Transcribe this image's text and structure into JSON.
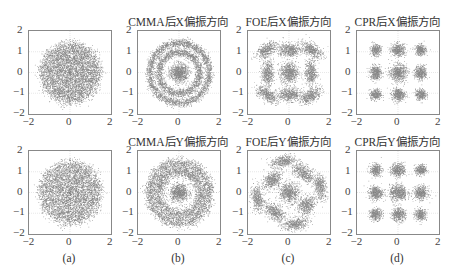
{
  "chart_data": [
    {
      "id": "a-x",
      "type": "scatter",
      "row": 0,
      "col": 0,
      "title": "",
      "xlim": [
        -2,
        2
      ],
      "ylim": [
        -2,
        2
      ],
      "xticks": [
        "-2",
        "0",
        "2"
      ],
      "yticks": [
        "2",
        "1",
        "0",
        "-1",
        "-2"
      ],
      "grid": true,
      "description": "Noisy unstructured disk of points, radius ~1.5, centered at origin",
      "clusters": [
        {
          "kind": "disk",
          "cx": 0,
          "cy": 0,
          "r": 1.45,
          "sigma": 0.25,
          "n": 5500
        }
      ]
    },
    {
      "id": "b-x",
      "type": "scatter",
      "row": 0,
      "col": 1,
      "title": "CMMA后X偏振方向",
      "xlim": [
        -2,
        2
      ],
      "ylim": [
        -2,
        2
      ],
      "xticks": [
        "-2",
        "0",
        "2"
      ],
      "yticks": [
        "2",
        "1",
        "0",
        "-1",
        "-2"
      ],
      "grid": true,
      "description": "Three concentric rings (16QAM amplitude levels) after CMMA",
      "clusters": [
        {
          "kind": "blob",
          "cx": 0,
          "cy": 0,
          "sx": 0.22,
          "sy": 0.22,
          "n": 900
        },
        {
          "kind": "ring",
          "cx": 0,
          "cy": 0,
          "r": 1.0,
          "sigma": 0.1,
          "n": 2000
        },
        {
          "kind": "ring",
          "cx": 0,
          "cy": 0,
          "r": 1.45,
          "sigma": 0.1,
          "n": 2600
        }
      ]
    },
    {
      "id": "c-x",
      "type": "scatter",
      "row": 0,
      "col": 2,
      "title": "FOE后X偏振方向",
      "xlim": [
        -2,
        2
      ],
      "ylim": [
        -2,
        2
      ],
      "xticks": [
        "-2",
        "0",
        "2"
      ],
      "yticks": [
        "2",
        "1",
        "0",
        "-1",
        "-2"
      ],
      "grid": true,
      "description": "9-point grid of elongated clusters after frequency offset estimation",
      "clusters": [
        {
          "kind": "blob",
          "cx": -1.1,
          "cy": 1.1,
          "sx": 0.28,
          "sy": 0.14,
          "rot": 35,
          "n": 450
        },
        {
          "kind": "blob",
          "cx": 0,
          "cy": 1.1,
          "sx": 0.3,
          "sy": 0.16,
          "rot": 0,
          "n": 550
        },
        {
          "kind": "blob",
          "cx": 1.1,
          "cy": 1.1,
          "sx": 0.28,
          "sy": 0.14,
          "rot": -35,
          "n": 450
        },
        {
          "kind": "blob",
          "cx": -1.05,
          "cy": 0,
          "sx": 0.14,
          "sy": 0.3,
          "rot": 0,
          "n": 500
        },
        {
          "kind": "blob",
          "cx": 0,
          "cy": 0,
          "sx": 0.22,
          "sy": 0.25,
          "rot": 0,
          "n": 700
        },
        {
          "kind": "blob",
          "cx": 1.05,
          "cy": 0,
          "sx": 0.14,
          "sy": 0.3,
          "rot": 0,
          "n": 500
        },
        {
          "kind": "blob",
          "cx": -1.1,
          "cy": -1.05,
          "sx": 0.28,
          "sy": 0.14,
          "rot": -35,
          "n": 450
        },
        {
          "kind": "blob",
          "cx": 0,
          "cy": -1.05,
          "sx": 0.3,
          "sy": 0.16,
          "rot": 0,
          "n": 550
        },
        {
          "kind": "blob",
          "cx": 1.05,
          "cy": -1.1,
          "sx": 0.28,
          "sy": 0.14,
          "rot": 35,
          "n": 450
        }
      ]
    },
    {
      "id": "d-x",
      "type": "scatter",
      "row": 0,
      "col": 3,
      "title": "CPR后X偏振方向",
      "xlim": [
        -2,
        2
      ],
      "ylim": [
        -2,
        2
      ],
      "xticks": [
        "-2",
        "0",
        "2"
      ],
      "yticks": [
        "2",
        "1",
        "0",
        "-1",
        "-2"
      ],
      "grid": true,
      "description": "Clean 3x3 constellation after carrier phase recovery",
      "clusters": [
        {
          "kind": "blob",
          "cx": -1.1,
          "cy": 1.1,
          "sx": 0.13,
          "sy": 0.13,
          "n": 350
        },
        {
          "kind": "blob",
          "cx": 0,
          "cy": 1.1,
          "sx": 0.17,
          "sy": 0.15,
          "n": 450
        },
        {
          "kind": "blob",
          "cx": 1.1,
          "cy": 1.1,
          "sx": 0.13,
          "sy": 0.13,
          "n": 350
        },
        {
          "kind": "blob",
          "cx": -1.1,
          "cy": 0,
          "sx": 0.14,
          "sy": 0.17,
          "n": 450
        },
        {
          "kind": "blob",
          "cx": 0,
          "cy": 0,
          "sx": 0.2,
          "sy": 0.2,
          "n": 650
        },
        {
          "kind": "blob",
          "cx": 1.1,
          "cy": 0,
          "sx": 0.14,
          "sy": 0.17,
          "n": 450
        },
        {
          "kind": "blob",
          "cx": -1.1,
          "cy": -1.05,
          "sx": 0.13,
          "sy": 0.13,
          "n": 350
        },
        {
          "kind": "blob",
          "cx": 0,
          "cy": -1.05,
          "sx": 0.16,
          "sy": 0.15,
          "n": 450
        },
        {
          "kind": "blob",
          "cx": 1.1,
          "cy": -1.05,
          "sx": 0.13,
          "sy": 0.13,
          "n": 350
        }
      ]
    },
    {
      "id": "a-y",
      "type": "scatter",
      "row": 1,
      "col": 0,
      "title": "",
      "xlim": [
        -2,
        2
      ],
      "ylim": [
        -2,
        2
      ],
      "xticks": [
        "-2",
        "0",
        "2"
      ],
      "yticks": [
        "2",
        "1",
        "0",
        "-1",
        "-2"
      ],
      "grid": true,
      "description": "Noisy unstructured disk of points, radius ~1.5, centered at origin",
      "clusters": [
        {
          "kind": "disk",
          "cx": 0,
          "cy": 0,
          "r": 1.5,
          "sigma": 0.25,
          "n": 5000
        }
      ]
    },
    {
      "id": "b-y",
      "type": "scatter",
      "row": 1,
      "col": 1,
      "title": "CMMA后Y偏振方向",
      "xlim": [
        -2,
        2
      ],
      "ylim": [
        -2,
        2
      ],
      "xticks": [
        "-2",
        "0",
        "2"
      ],
      "yticks": [
        "2",
        "1",
        "0",
        "-1",
        "-2"
      ],
      "grid": true,
      "description": "Concentric rings after CMMA, outer rings broader",
      "clusters": [
        {
          "kind": "blob",
          "cx": 0,
          "cy": 0,
          "sx": 0.22,
          "sy": 0.2,
          "n": 800
        },
        {
          "kind": "ring",
          "cx": 0,
          "cy": 0,
          "r": 1.05,
          "sigma": 0.15,
          "n": 2200
        },
        {
          "kind": "ring",
          "cx": 0,
          "cy": 0,
          "r": 1.45,
          "sigma": 0.14,
          "n": 2400
        }
      ]
    },
    {
      "id": "c-y",
      "type": "scatter",
      "row": 1,
      "col": 2,
      "title": "FOE后Y偏振方向",
      "xlim": [
        -2,
        2
      ],
      "ylim": [
        -2,
        2
      ],
      "xticks": [
        "-2",
        "0",
        "2"
      ],
      "yticks": [
        "2",
        "1",
        "0",
        "-1",
        "-2"
      ],
      "grid": true,
      "description": "Rotated (~45°) 3x3 constellation after FOE",
      "clusters": [
        {
          "kind": "blob",
          "cx": -0.3,
          "cy": 1.5,
          "sx": 0.3,
          "sy": 0.15,
          "rot": 10,
          "n": 450
        },
        {
          "kind": "blob",
          "cx": -0.85,
          "cy": 0.6,
          "sx": 0.25,
          "sy": 0.18,
          "rot": 45,
          "n": 500
        },
        {
          "kind": "blob",
          "cx": 0.7,
          "cy": 0.95,
          "sx": 0.3,
          "sy": 0.17,
          "rot": -40,
          "n": 500
        },
        {
          "kind": "blob",
          "cx": -1.55,
          "cy": -0.3,
          "sx": 0.15,
          "sy": 0.3,
          "rot": 10,
          "n": 450
        },
        {
          "kind": "blob",
          "cx": 0,
          "cy": 0,
          "sx": 0.24,
          "sy": 0.24,
          "n": 650
        },
        {
          "kind": "blob",
          "cx": 1.5,
          "cy": 0.3,
          "sx": 0.15,
          "sy": 0.3,
          "rot": 10,
          "n": 450
        },
        {
          "kind": "blob",
          "cx": -0.7,
          "cy": -0.95,
          "sx": 0.3,
          "sy": 0.17,
          "rot": -40,
          "n": 500
        },
        {
          "kind": "blob",
          "cx": 0.85,
          "cy": -0.6,
          "sx": 0.25,
          "sy": 0.18,
          "rot": 45,
          "n": 500
        },
        {
          "kind": "blob",
          "cx": 0.3,
          "cy": -1.5,
          "sx": 0.3,
          "sy": 0.15,
          "rot": 10,
          "n": 450
        }
      ]
    },
    {
      "id": "d-y",
      "type": "scatter",
      "row": 1,
      "col": 3,
      "title": "CPR后Y偏振方向",
      "xlim": [
        -2,
        2
      ],
      "ylim": [
        -2,
        2
      ],
      "xticks": [
        "-2",
        "0",
        "2"
      ],
      "yticks": [
        "2",
        "1",
        "0",
        "-1",
        "-2"
      ],
      "grid": true,
      "description": "Clean 3x3 constellation after CPR",
      "clusters": [
        {
          "kind": "blob",
          "cx": -1.1,
          "cy": 1.1,
          "sx": 0.14,
          "sy": 0.14,
          "n": 380
        },
        {
          "kind": "blob",
          "cx": 0,
          "cy": 1.1,
          "sx": 0.17,
          "sy": 0.16,
          "n": 450
        },
        {
          "kind": "blob",
          "cx": 1.1,
          "cy": 1.1,
          "sx": 0.13,
          "sy": 0.13,
          "n": 350
        },
        {
          "kind": "blob",
          "cx": -1.1,
          "cy": 0,
          "sx": 0.17,
          "sy": 0.16,
          "n": 480
        },
        {
          "kind": "blob",
          "cx": 0,
          "cy": 0,
          "sx": 0.21,
          "sy": 0.19,
          "n": 650
        },
        {
          "kind": "blob",
          "cx": 1.1,
          "cy": 0,
          "sx": 0.17,
          "sy": 0.16,
          "n": 480
        },
        {
          "kind": "blob",
          "cx": -1.1,
          "cy": -1.05,
          "sx": 0.15,
          "sy": 0.14,
          "n": 380
        },
        {
          "kind": "blob",
          "cx": 0,
          "cy": -1.05,
          "sx": 0.17,
          "sy": 0.16,
          "n": 450
        },
        {
          "kind": "blob",
          "cx": 1.1,
          "cy": -1.05,
          "sx": 0.14,
          "sy": 0.14,
          "n": 350
        }
      ]
    }
  ],
  "captions": [
    "(a)",
    "(b)",
    "(c)",
    "(d)"
  ],
  "colors": {
    "points": "#2b2b2b",
    "axis": "#888888",
    "grid": "#d8d8d8"
  }
}
